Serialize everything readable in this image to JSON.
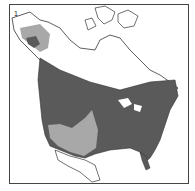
{
  "map": {
    "panel_label": "1",
    "colors": {
      "background": "#ffffff",
      "border": "#444444",
      "land": "#ffffff",
      "outline": "#333333",
      "range_dark": "#5a5a5a",
      "range_light": "#a8a8a8"
    },
    "regions": [
      "Alaska",
      "Canada",
      "United States",
      "Mexico"
    ],
    "legend": []
  }
}
